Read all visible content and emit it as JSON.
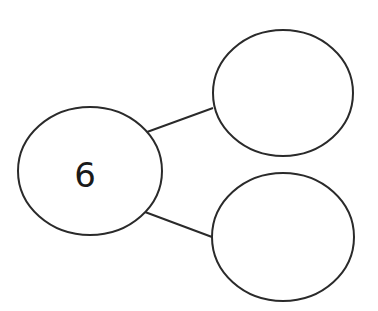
{
  "diagram": {
    "type": "number-bond",
    "whole": {
      "label": "6",
      "cx": 90,
      "cy": 171,
      "rx": 72,
      "ry": 64
    },
    "parts": [
      {
        "label": "",
        "cx": 283,
        "cy": 93,
        "rx": 70,
        "ry": 63
      },
      {
        "label": "",
        "cx": 283,
        "cy": 237,
        "rx": 71,
        "ry": 64
      }
    ],
    "connectors": [
      {
        "x1": 147,
        "y1": 132,
        "x2": 213,
        "y2": 108
      },
      {
        "x1": 145,
        "y1": 212,
        "x2": 212,
        "y2": 237
      }
    ],
    "stroke_color": "#2a2a2a"
  }
}
